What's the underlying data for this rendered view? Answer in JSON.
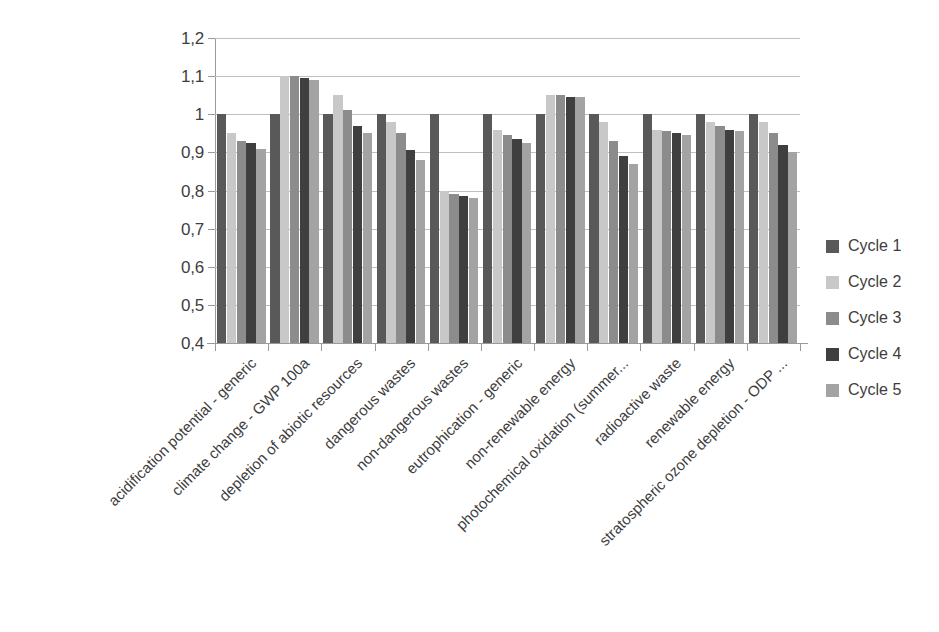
{
  "chart_data": {
    "type": "bar",
    "title": "",
    "subtitle": "",
    "xlabel": "",
    "ylabel": "",
    "ylim": [
      0.4,
      1.2
    ],
    "y_tick_labels": [
      "1,2",
      "1,1",
      "1",
      "0,9",
      "0,8",
      "0,7",
      "0,6",
      "0,5",
      "0,4"
    ],
    "y_tick_values": [
      1.2,
      1.1,
      1.0,
      0.9,
      0.8,
      0.7,
      0.6,
      0.5,
      0.4
    ],
    "grid": true,
    "legend_position": "right",
    "decimal_separator": ",",
    "categories": [
      "acidification potential - generic",
      "climate change - GWP 100a",
      "depletion of abiotic resources",
      "dangerous wastes",
      "non-dangerous wastes",
      "eutrophication - generic",
      "non-renewable energy",
      "photochemical oxidation (summer...",
      "radioactive waste",
      "renewable energy",
      "stratospheric ozone depletion - ODP ..."
    ],
    "series": [
      {
        "name": "Cycle 1",
        "color": "#595959",
        "values": [
          1.0,
          1.0,
          1.0,
          1.0,
          1.0,
          1.0,
          1.0,
          1.0,
          1.0,
          1.0,
          1.0
        ]
      },
      {
        "name": "Cycle 2",
        "color": "#c8c8c8",
        "values": [
          0.95,
          1.1,
          1.05,
          0.98,
          0.8,
          0.96,
          1.05,
          0.98,
          0.96,
          0.98,
          0.98
        ]
      },
      {
        "name": "Cycle 3",
        "color": "#8c8c8c",
        "values": [
          0.93,
          1.1,
          1.01,
          0.95,
          0.79,
          0.945,
          1.05,
          0.93,
          0.955,
          0.97,
          0.95
        ]
      },
      {
        "name": "Cycle 4",
        "color": "#3f3f3f",
        "values": [
          0.925,
          1.095,
          0.97,
          0.905,
          0.785,
          0.935,
          1.045,
          0.89,
          0.95,
          0.96,
          0.92
        ]
      },
      {
        "name": "Cycle 5",
        "color": "#a3a3a3",
        "values": [
          0.91,
          1.09,
          0.95,
          0.88,
          0.78,
          0.925,
          1.045,
          0.87,
          0.945,
          0.955,
          0.9
        ]
      }
    ]
  },
  "legend": {
    "items": [
      {
        "label": "Cycle 1",
        "color": "#595959"
      },
      {
        "label": "Cycle 2",
        "color": "#c8c8c8"
      },
      {
        "label": "Cycle 3",
        "color": "#8c8c8c"
      },
      {
        "label": "Cycle 4",
        "color": "#3f3f3f"
      },
      {
        "label": "Cycle 5",
        "color": "#a3a3a3"
      }
    ]
  }
}
